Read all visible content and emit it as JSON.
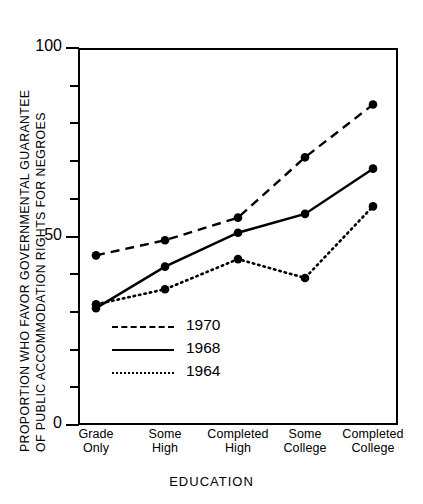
{
  "chart_data": {
    "type": "line",
    "title": "",
    "xlabel": "EDUCATION",
    "ylabel_line1": "PROPORTION  WHO  FAVOR  GOVERNMENTAL  GUARANTEE",
    "ylabel_line2": "OF  PUBLIC  ACCOMMODATION  RIGHTS  FOR  NEGROES",
    "categories": [
      "Grade\nOnly",
      "Some\nHigh",
      "Completed\nHigh",
      "Some\nCollege",
      "Completed\nCollege"
    ],
    "category_lines": [
      [
        "Grade",
        "Only"
      ],
      [
        "Some",
        "High"
      ],
      [
        "Completed",
        "High"
      ],
      [
        "Some",
        "College"
      ],
      [
        "Completed",
        "College"
      ]
    ],
    "ylim": [
      0,
      100
    ],
    "ytick_labels": [
      "0",
      "50",
      "100"
    ],
    "ytick_values": [
      0,
      50,
      100
    ],
    "yticks_minor": [
      10,
      20,
      30,
      40,
      60,
      70,
      80,
      90
    ],
    "grid": false,
    "legend_position": "inside-lower-left",
    "series": [
      {
        "name": "1970",
        "style": "dashed",
        "color": "#000000",
        "values": [
          45,
          49,
          55,
          71,
          85
        ]
      },
      {
        "name": "1968",
        "style": "solid",
        "color": "#000000",
        "values": [
          31,
          42,
          51,
          56,
          68
        ]
      },
      {
        "name": "1964",
        "style": "dotted",
        "color": "#000000",
        "values": [
          32,
          36,
          44,
          39,
          58
        ]
      }
    ]
  },
  "axis": {
    "y_label_100": "100",
    "y_label_50": "50",
    "y_label_0": "0"
  },
  "legend": {
    "items": [
      {
        "label": "1970"
      },
      {
        "label": "1968"
      },
      {
        "label": "1964"
      }
    ]
  }
}
